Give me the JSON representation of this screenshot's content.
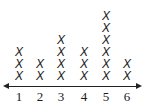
{
  "chart_data": {
    "type": "dot",
    "title": "",
    "xlabel": "",
    "ylabel": "",
    "marker": "X",
    "categories": [
      "1",
      "2",
      "3",
      "4",
      "5",
      "6"
    ],
    "values": [
      3,
      2,
      4,
      3,
      6,
      2
    ],
    "axis": {
      "arrows": "both",
      "grid": false
    },
    "legend": null
  }
}
